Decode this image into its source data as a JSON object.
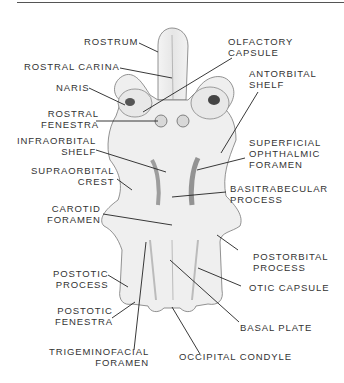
{
  "figure": {
    "labels": {
      "rostrum": [
        "ROSTRUM"
      ],
      "rostral_carina": [
        "ROSTRAL CARINA"
      ],
      "naris": [
        "NARIS"
      ],
      "rostral_fenestra": [
        "ROSTRAL",
        "FENESTRA"
      ],
      "infraorbital_shelf": [
        "INFRAORBITAL",
        "SHELF"
      ],
      "supraorbital_crest": [
        "SUPRAORBITAL",
        "CREST"
      ],
      "carotid_foramen": [
        "CAROTID",
        "FORAMEN"
      ],
      "postotic_process": [
        "POSTOTIC",
        "PROCESS"
      ],
      "postotic_fenestra": [
        "POSTOTIC",
        "FENESTRA"
      ],
      "trigeminofacial_foramen": [
        "TRIGEMINOFACIAL",
        "FORAMEN"
      ],
      "olfactory_capsule": [
        "OLFACTORY",
        "CAPSULE"
      ],
      "antorbital_shelf": [
        "ANTORBITAL",
        "SHELF"
      ],
      "superficial_ophthalmic_foramen": [
        "SUPERFICIAL",
        "OPHTHALMIC",
        "FORAMEN"
      ],
      "basitrabecular_process": [
        "BASITRABECULAR",
        "PROCESS"
      ],
      "postorbital_process": [
        "POSTORBITAL",
        "PROCESS"
      ],
      "otic_capsule": [
        "OTIC CAPSULE"
      ],
      "basal_plate": [
        "BASAL PLATE"
      ],
      "occipital_condyle": [
        "OCCIPITAL CONDYLE"
      ]
    },
    "colors": {
      "line": "#222222",
      "text": "#333333",
      "shade": "#9a9a9a"
    }
  }
}
